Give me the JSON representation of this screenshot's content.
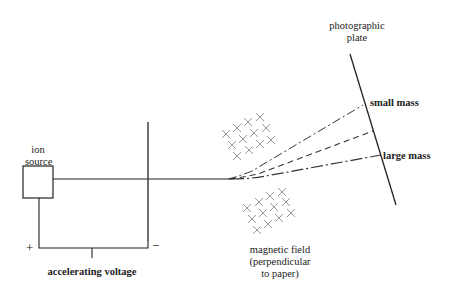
{
  "diagram": {
    "labels": {
      "ion_source": [
        "ion",
        "source"
      ],
      "photographic_plate": [
        "photographic",
        "plate"
      ],
      "small_mass": "small mass",
      "large_mass": "large mass",
      "magnetic_field": [
        "magnetic field",
        "(perpendicular",
        "to paper)"
      ],
      "accelerating_voltage": "accelerating voltage",
      "plus_terminal": "+",
      "minus_terminal": "−"
    },
    "beams": [
      {
        "name": "small mass",
        "style": "dash-dot-long"
      },
      {
        "name": "intermediate",
        "style": "dashed"
      },
      {
        "name": "large mass",
        "style": "dash-dot"
      }
    ],
    "colors": {
      "line": "#222222",
      "field_crosses": "#9a9a9a",
      "background": "#ffffff"
    }
  }
}
